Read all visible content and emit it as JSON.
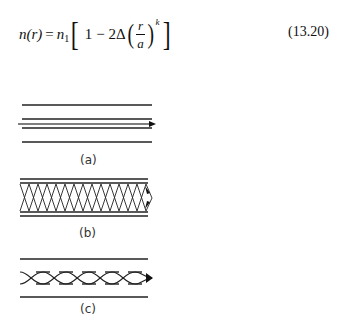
{
  "equation": {
    "lhs": "n(r)",
    "equals": "=",
    "n1": "n",
    "n1_sub": "1",
    "one": "1",
    "minus": "−",
    "two_delta": "2Δ",
    "frac_num": "r",
    "frac_den": "a",
    "exponent": "k",
    "number": "(13.20)"
  },
  "figures": [
    {
      "id": "a",
      "label": "(a)",
      "type": "single-mode fiber, straight axial ray"
    },
    {
      "id": "b",
      "label": "(b)",
      "type": "step-index multimode fiber, zig-zag rays"
    },
    {
      "id": "c",
      "label": "(c)",
      "type": "graded-index multimode fiber, curved rays"
    }
  ]
}
